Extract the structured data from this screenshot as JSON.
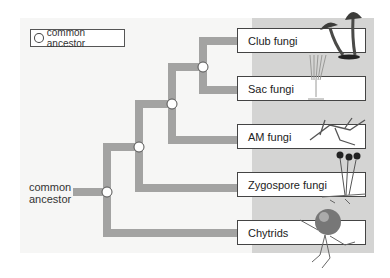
{
  "legend": {
    "label": "common ancestor",
    "icon": "circle-node-icon"
  },
  "root_label": "common\nancestor",
  "root_label_lines": [
    "common",
    "ancestor"
  ],
  "taxa": [
    {
      "label": "Club fungi",
      "organism_icon": "mushroom-icon"
    },
    {
      "label": "Sac fungi",
      "organism_icon": "ascocarp-icon"
    },
    {
      "label": "AM fungi",
      "organism_icon": "branched-hyphae-icon"
    },
    {
      "label": "Zygospore fungi",
      "organism_icon": "sporangia-icon"
    },
    {
      "label": "Chytrids",
      "organism_icon": "chytrid-sphere-icon"
    }
  ],
  "colors": {
    "branch": "#a3a3a2",
    "panel": "#f6f6f5",
    "gray_panel": "#d4d4d3",
    "node_fill": "#ffffff"
  }
}
